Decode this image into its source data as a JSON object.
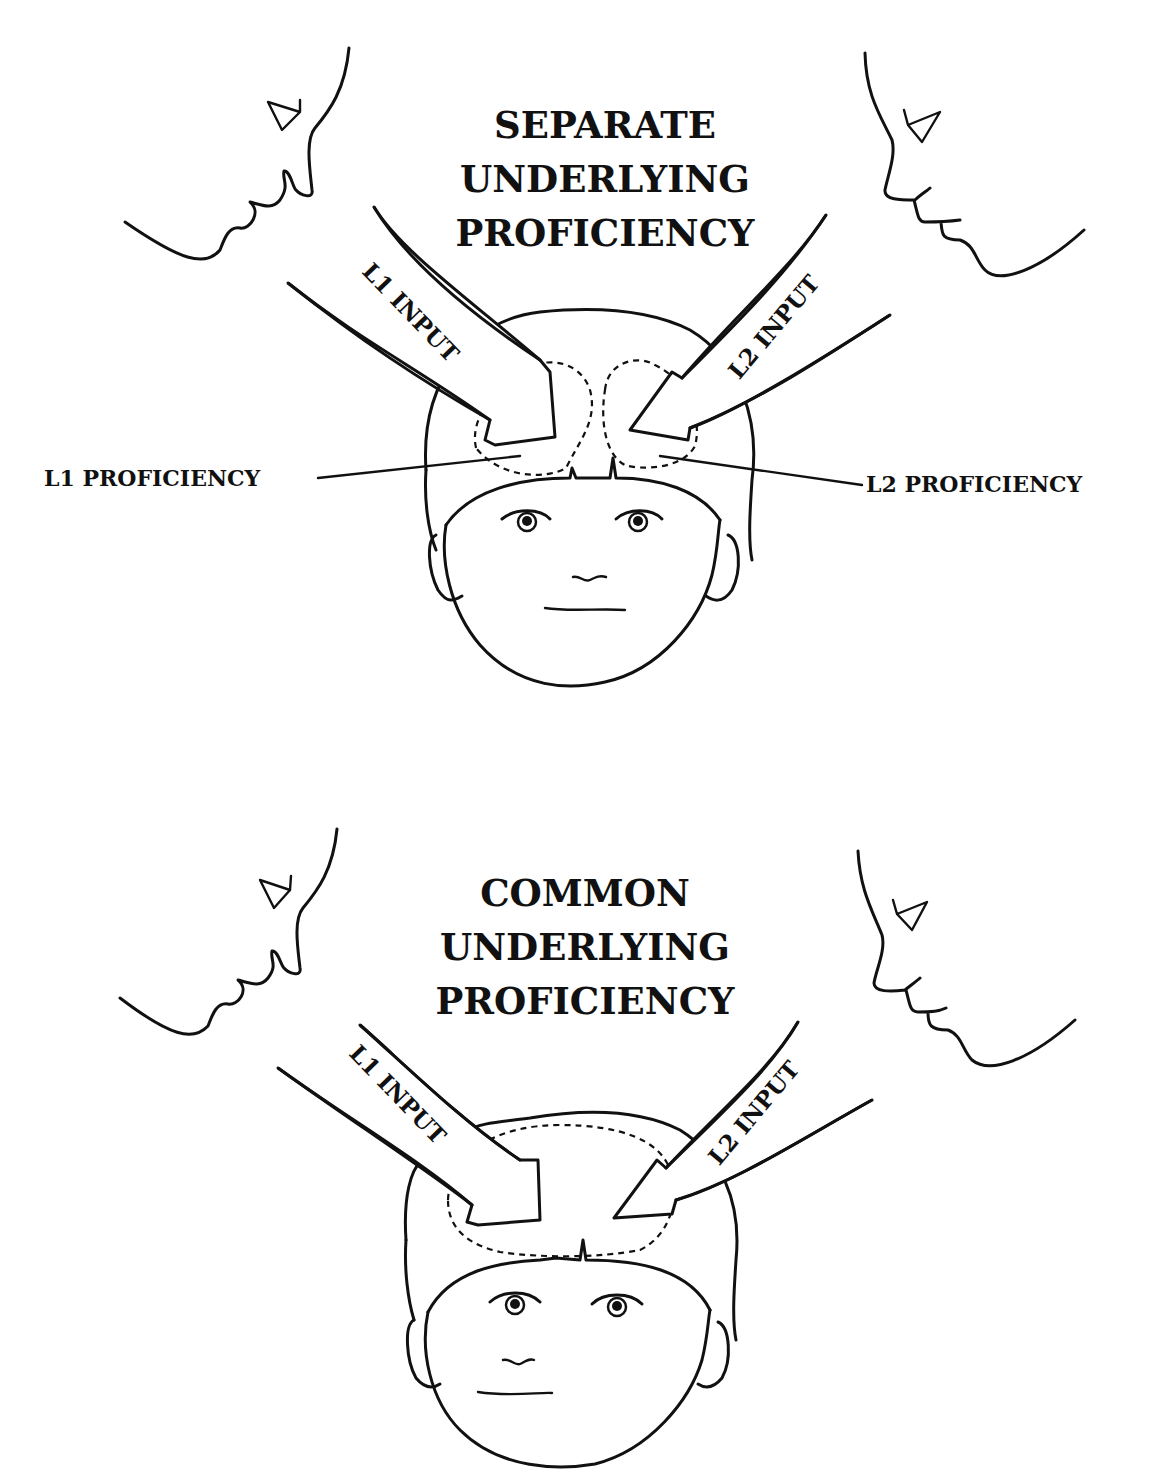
{
  "panels": [
    {
      "id": "separate",
      "title_lines": [
        "SEPARATE",
        "UNDERLYING",
        "PROFICIENCY"
      ],
      "left_arrow_label": "L1 INPUT",
      "right_arrow_label": "L2 INPUT",
      "left_proficiency_label": "L1 PROFICIENCY",
      "right_proficiency_label": "L2 PROFICIENCY"
    },
    {
      "id": "common",
      "title_lines": [
        "COMMON",
        "UNDERLYING",
        "PROFICIENCY"
      ],
      "left_arrow_label": "L1 INPUT",
      "right_arrow_label": "L2 INPUT"
    }
  ],
  "colors": {
    "ink": "#111111",
    "background": "#ffffff"
  }
}
